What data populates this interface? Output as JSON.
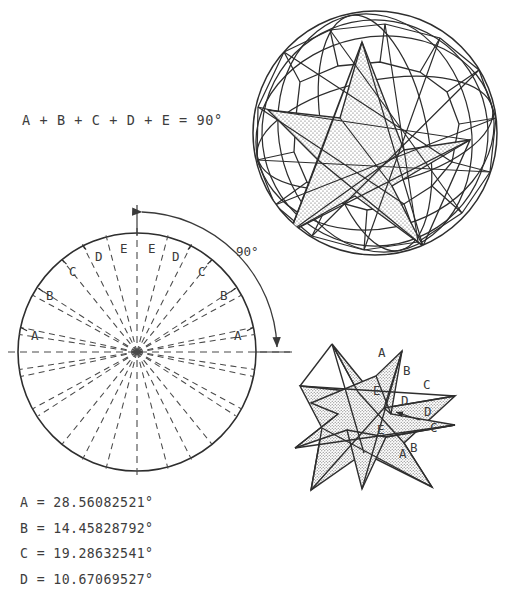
{
  "equation": {
    "text": "A + B + C + D + E = 90°"
  },
  "angle_values": [
    {
      "name": "A",
      "text": "A = 28.56082521°"
    },
    {
      "name": "B",
      "text": "B = 14.45828792°"
    },
    {
      "name": "C",
      "text": "C = 19.28632541°"
    },
    {
      "name": "D",
      "text": "D = 10.67069527°"
    }
  ],
  "protractor": {
    "arc_label": "90°",
    "sector_labels_left": [
      "A",
      "B",
      "C",
      "D",
      "E"
    ],
    "sector_labels_right": [
      "E",
      "D",
      "C",
      "B",
      "A"
    ],
    "label_A_left": "A",
    "label_B_left": "B",
    "label_C_left": "C",
    "label_D_left": "D",
    "label_E_left": "E",
    "label_E_right": "E",
    "label_D_right": "D",
    "label_C_right": "C",
    "label_B_right": "B",
    "label_A_right": "A"
  },
  "star_figure": {
    "labels": {
      "A_top": "A",
      "B_top": "B",
      "C_upper": "C",
      "D_inner": "D",
      "D_arrow": "D",
      "E_upper": "E",
      "E_lower": "E",
      "C_lower": "C",
      "B_lower": "B",
      "A_bottom": "A"
    }
  },
  "colors": {
    "ink": "#2e2e2e",
    "text": "#3a3a3a",
    "stipple": "#8a8a8a",
    "paper": "#ffffff"
  }
}
